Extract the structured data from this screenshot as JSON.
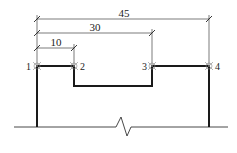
{
  "diagram": {
    "type": "structural-profile-with-dimensions",
    "dimensions": [
      {
        "id": "dim-45",
        "label": "45",
        "from_point": "1",
        "to_point": "4"
      },
      {
        "id": "dim-30",
        "label": "30",
        "from_point": "1",
        "to_point": "3"
      },
      {
        "id": "dim-10",
        "label": "10",
        "from_point": "1",
        "to_point": "2"
      }
    ],
    "points": [
      {
        "id": "1",
        "label": "1"
      },
      {
        "id": "2",
        "label": "2"
      },
      {
        "id": "3",
        "label": "3"
      },
      {
        "id": "4",
        "label": "4"
      }
    ],
    "colors": {
      "line": "#1a1a1a",
      "dim_line": "#333333",
      "background": "#ffffff"
    }
  }
}
